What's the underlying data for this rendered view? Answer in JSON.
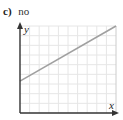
{
  "label": {
    "letter": "c)",
    "text": "no"
  },
  "chart_data": {
    "type": "line",
    "title": "",
    "xlabel": "x",
    "ylabel": "y",
    "grid": true,
    "grid_cells": {
      "columns": 10,
      "rows": 9
    },
    "series": [
      {
        "name": "line",
        "color": "#a0a0a0",
        "points": [
          [
            0,
            3.3
          ],
          [
            10,
            9
          ]
        ]
      }
    ],
    "xlim": [
      0,
      10
    ],
    "ylim": [
      0,
      9
    ],
    "colors": {
      "axis": "#333333",
      "grid": "#e6e6e6",
      "border": "#cccccc",
      "line": "#a0a0a0"
    }
  }
}
